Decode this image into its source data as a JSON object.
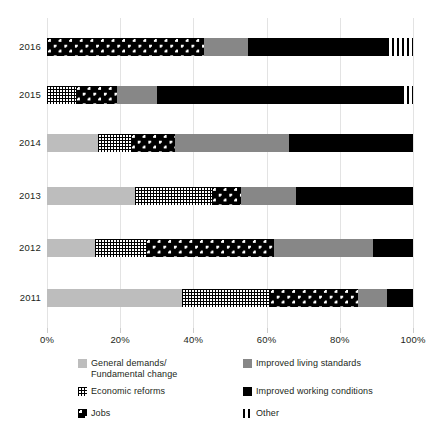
{
  "chart_data": {
    "type": "bar",
    "orientation": "horizontal",
    "stacked": true,
    "normalized": true,
    "title": "",
    "subtitle": "",
    "xlabel": "",
    "ylabel": "",
    "xlim": [
      0,
      100
    ],
    "grid": true,
    "legend_position": "bottom",
    "categories": [
      "2016",
      "2015",
      "2014",
      "2013",
      "2012",
      "2011"
    ],
    "tick_labels": [
      "0%",
      "20%",
      "40%",
      "60%",
      "80%",
      "100%"
    ],
    "tick_values": [
      0,
      20,
      40,
      60,
      80,
      100
    ],
    "series": [
      {
        "name": "General demands/\nFundamental change",
        "key": "general",
        "pattern": "solid-light-gray",
        "color": "#bdbdbd",
        "values": [
          0,
          0,
          14,
          24,
          13,
          37
        ]
      },
      {
        "name": "Economic reforms",
        "key": "reforms",
        "pattern": "grid-hatch",
        "color": "#000000",
        "values": [
          0,
          8,
          9,
          21,
          14,
          24
        ]
      },
      {
        "name": "Jobs",
        "key": "jobs",
        "pattern": "bold-dot-checker",
        "color": "#000000",
        "values": [
          43,
          11,
          12,
          8,
          35,
          24
        ]
      },
      {
        "name": "Improved living standards",
        "key": "living",
        "pattern": "solid-mid-gray",
        "color": "#878787",
        "values": [
          12,
          11,
          31,
          15,
          27,
          8
        ]
      },
      {
        "name": "Improved working conditions",
        "key": "working",
        "pattern": "solid-black",
        "color": "#000000",
        "values": [
          38,
          67,
          33,
          31,
          11,
          7
        ]
      },
      {
        "name": "Other",
        "key": "other",
        "pattern": "vertical-stripes",
        "color": "#000000",
        "values": [
          7,
          3,
          0,
          0,
          0,
          0
        ]
      }
    ]
  },
  "rows": [
    {
      "year": "2016",
      "segments": [
        {
          "key": "jobs",
          "start": 0,
          "size": 43
        },
        {
          "key": "living",
          "start": 43,
          "size": 12
        },
        {
          "key": "working",
          "start": 55,
          "size": 38
        },
        {
          "key": "other",
          "start": 93,
          "size": 7
        }
      ]
    },
    {
      "year": "2015",
      "segments": [
        {
          "key": "reforms",
          "start": 0,
          "size": 8
        },
        {
          "key": "jobs",
          "start": 8,
          "size": 11
        },
        {
          "key": "living",
          "start": 19,
          "size": 11
        },
        {
          "key": "working",
          "start": 30,
          "size": 67
        },
        {
          "key": "other",
          "start": 97,
          "size": 3
        }
      ]
    },
    {
      "year": "2014",
      "segments": [
        {
          "key": "general",
          "start": 0,
          "size": 14
        },
        {
          "key": "reforms",
          "start": 14,
          "size": 9
        },
        {
          "key": "jobs",
          "start": 23,
          "size": 12
        },
        {
          "key": "living",
          "start": 35,
          "size": 31
        },
        {
          "key": "working",
          "start": 66,
          "size": 34
        }
      ]
    },
    {
      "year": "2013",
      "segments": [
        {
          "key": "general",
          "start": 0,
          "size": 24
        },
        {
          "key": "reforms",
          "start": 24,
          "size": 21
        },
        {
          "key": "jobs",
          "start": 45,
          "size": 8
        },
        {
          "key": "living",
          "start": 53,
          "size": 15
        },
        {
          "key": "working",
          "start": 68,
          "size": 32
        }
      ]
    },
    {
      "year": "2012",
      "segments": [
        {
          "key": "general",
          "start": 0,
          "size": 13
        },
        {
          "key": "reforms",
          "start": 13,
          "size": 14
        },
        {
          "key": "jobs",
          "start": 27,
          "size": 35
        },
        {
          "key": "living",
          "start": 62,
          "size": 27
        },
        {
          "key": "working",
          "start": 89,
          "size": 11
        }
      ]
    },
    {
      "year": "2011",
      "segments": [
        {
          "key": "general",
          "start": 0,
          "size": 37
        },
        {
          "key": "reforms",
          "start": 37,
          "size": 24
        },
        {
          "key": "jobs",
          "start": 61,
          "size": 24
        },
        {
          "key": "living",
          "start": 85,
          "size": 8
        },
        {
          "key": "working",
          "start": 93,
          "size": 7
        }
      ]
    }
  ],
  "legend": {
    "items": [
      {
        "key": "general",
        "label": "General demands/\nFundamental change",
        "col": 0,
        "row": 0
      },
      {
        "key": "reforms",
        "label": "Economic reforms",
        "col": 0,
        "row": 1
      },
      {
        "key": "jobs",
        "label": "Jobs",
        "col": 0,
        "row": 2
      },
      {
        "key": "living",
        "label": "Improved living standards",
        "col": 1,
        "row": 0
      },
      {
        "key": "working",
        "label": "Improved working conditions",
        "col": 1,
        "row": 1
      },
      {
        "key": "other",
        "label": "Other",
        "col": 1,
        "row": 2
      }
    ]
  },
  "colors": {
    "general": "#bdbdbd",
    "living": "#878787",
    "working": "#000000",
    "grid": "#e3e3e3",
    "text": "#231f20"
  }
}
